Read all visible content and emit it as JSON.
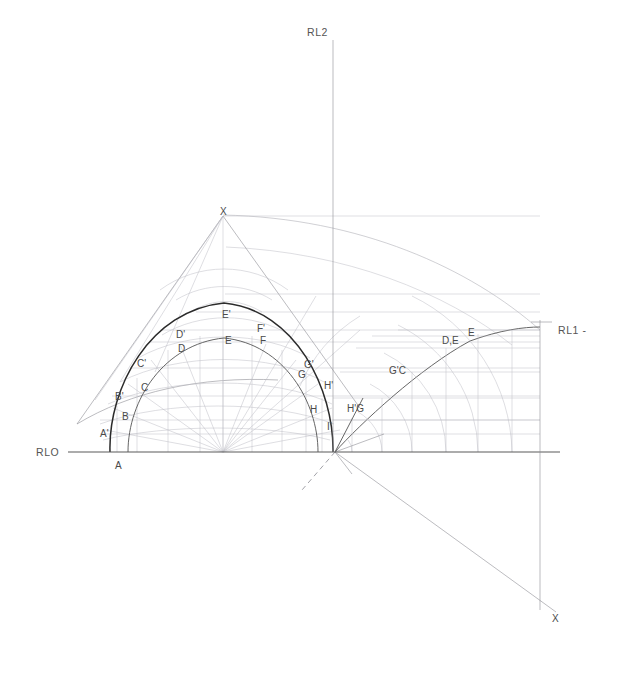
{
  "drawing": {
    "title": "Descriptive geometry construction - arch development",
    "canvas": {
      "width": 626,
      "height": 673,
      "background": "#ffffff"
    },
    "colors": {
      "heavy_line": "#2b2b2b",
      "medium_line": "#555555",
      "thin_line": "#8f8f96",
      "faint_line": "#a8a8b0",
      "baseline": "#5a5a5a",
      "label_text": "#4a4a4a"
    },
    "reference_lines": [
      {
        "name": "RLO",
        "label": "RLO",
        "x": 40,
        "y": 452,
        "orientation": "horizontal"
      },
      {
        "name": "RL2",
        "label": "RL2",
        "x": 308,
        "y": 33,
        "orientation": "vertical"
      },
      {
        "name": "RL1",
        "label": "RL1 -",
        "x": 541,
        "y": 330,
        "orientation": "vertical"
      }
    ],
    "apex_labels": [
      {
        "name": "apex-top",
        "label": "X",
        "x": 223,
        "y": 215
      },
      {
        "name": "apex-bottom-right",
        "label": "X",
        "x": 554,
        "y": 620
      }
    ],
    "baseline_labels": [
      {
        "name": "point-A",
        "label": "A",
        "x": 117,
        "y": 466
      }
    ],
    "outer_curve_labels": [
      {
        "label": "A'",
        "x": 100,
        "y": 434
      },
      {
        "label": "B'",
        "x": 116,
        "y": 397
      },
      {
        "label": "C'",
        "x": 139,
        "y": 364
      },
      {
        "label": "D'",
        "x": 178,
        "y": 335
      },
      {
        "label": "E'",
        "x": 225,
        "y": 315
      },
      {
        "label": "F'",
        "x": 259,
        "y": 329
      },
      {
        "label": "G'",
        "x": 306,
        "y": 365
      },
      {
        "label": "H'",
        "x": 326,
        "y": 386
      },
      {
        "label": "I'",
        "x": 329,
        "y": 427
      }
    ],
    "inner_curve_labels": [
      {
        "label": "B",
        "x": 124,
        "y": 417
      },
      {
        "label": "C",
        "x": 143,
        "y": 388
      },
      {
        "label": "D",
        "x": 180,
        "y": 349
      },
      {
        "label": "E",
        "x": 227,
        "y": 341
      },
      {
        "label": "F",
        "x": 262,
        "y": 341
      },
      {
        "label": "G",
        "x": 300,
        "y": 375
      },
      {
        "label": "H",
        "x": 312,
        "y": 410
      }
    ],
    "development_labels": [
      {
        "label": "H'G",
        "x": 350,
        "y": 409
      },
      {
        "label": "G'C",
        "x": 392,
        "y": 371
      },
      {
        "label": "D,E",
        "x": 445,
        "y": 341
      },
      {
        "label": "E",
        "x": 470,
        "y": 333
      }
    ]
  }
}
